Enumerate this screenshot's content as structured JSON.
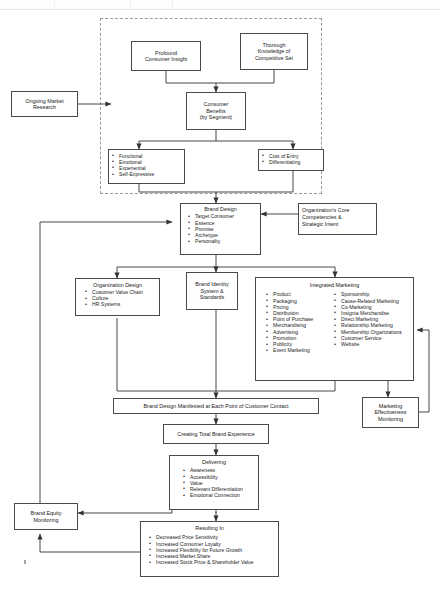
{
  "diagram": {
    "nodes": {
      "ongoing_market_research": {
        "label": "Ongoing Market\nResearch",
        "lines": [
          "Ongoing Market",
          "Research"
        ]
      },
      "profound_consumer_insight": {
        "lines": [
          "Profound",
          "Consumer Insight"
        ]
      },
      "thorough_knowledge": {
        "lines": [
          "Thorough",
          "Knowledge of",
          "Competitive Set"
        ]
      },
      "consumer_benefits": {
        "lines": [
          "Consumer",
          "Benefits",
          "(by Segment)"
        ]
      },
      "benefit_types": {
        "items": [
          "Functional",
          "Emotional",
          "Experiential",
          "Self-Expressive"
        ]
      },
      "benefit_roles": {
        "items": [
          "Cost of Entry",
          "Differentiating"
        ]
      },
      "brand_design": {
        "title": "Brand Design",
        "items": [
          "Target Consumer",
          "Essence",
          "Promise",
          "Archetype",
          "Personality"
        ]
      },
      "org_core_competencies": {
        "lines": [
          "Organization's Core",
          "Competencies &",
          "Strategic Intent"
        ]
      },
      "organization_design": {
        "title": "Organization Design",
        "items": [
          "Customer Value Chain",
          "Culture",
          "HR Systems"
        ]
      },
      "brand_identity_system": {
        "lines": [
          "Brand Identity",
          "System &",
          "Standards"
        ]
      },
      "integrated_marketing": {
        "title": "Integrated Marketing",
        "items_left": [
          "Product",
          "Packaging",
          "Pricing",
          "Distribution",
          "Point of Purchase",
          "Merchandising",
          "Advertising",
          "Promotion",
          "Publicity",
          "Event Marketing"
        ],
        "items_right": [
          "Sponsorship",
          "Cause-Related Marketing",
          "Co-Marketing",
          "Insignia Merchandise",
          "Direct Marketing",
          "Relationship Marketing",
          "Membership Organizations",
          "Customer Service",
          "Website"
        ]
      },
      "brand_design_manifested": {
        "label": "Brand Design Manifested at Each Point of Customer Contact"
      },
      "marketing_effectiveness": {
        "lines": [
          "Marketing",
          "Effectiveness",
          "Monitoring"
        ]
      },
      "creating_total_brand_experience": {
        "label": "Creating Total Brand Experience"
      },
      "delivering": {
        "title": "Delivering",
        "items": [
          "Awareness",
          "Accessibility",
          "Value",
          "Relevant Differentiation",
          "Emotional Connection"
        ]
      },
      "brand_equity_monitoring": {
        "lines": [
          "Brand Equity",
          "Monitoring"
        ]
      },
      "resulting_in": {
        "title": "Resulting In",
        "items": [
          "Decreased Price Sensitivity",
          "Increased Consumer Loyalty",
          "Increased Flexibility for Future Growth",
          "Increased Market Share",
          "Increased Stock Price & Shareholder Value"
        ]
      }
    },
    "colors": {
      "box_border": "#4a4a4a",
      "dashed_border": "#9a9aa2",
      "connector": "#333333",
      "background": "#ffffff"
    }
  }
}
